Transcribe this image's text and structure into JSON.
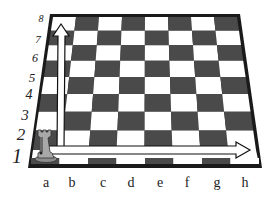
{
  "figure": {
    "colors": {
      "dark_square": "#4a4a4a",
      "light_square": "#ffffff",
      "frame": "#1a1a1a",
      "rook": "#9a9a9a"
    },
    "ranks": [
      {
        "label": "8",
        "x": 41,
        "y": 19,
        "size": 10
      },
      {
        "label": "7",
        "x": 38,
        "y": 39,
        "size": 11
      },
      {
        "label": "6",
        "x": 35,
        "y": 58,
        "size": 12
      },
      {
        "label": "5",
        "x": 32,
        "y": 77,
        "size": 13
      },
      {
        "label": "4",
        "x": 29,
        "y": 95,
        "size": 14
      },
      {
        "label": "3",
        "x": 25,
        "y": 115,
        "size": 15
      },
      {
        "label": "2",
        "x": 21,
        "y": 134,
        "size": 17
      },
      {
        "label": "1",
        "x": 17,
        "y": 156,
        "size": 20
      }
    ],
    "files": [
      {
        "label": "a",
        "x": 46,
        "y": 183
      },
      {
        "label": "b",
        "x": 72,
        "y": 183
      },
      {
        "label": "c",
        "x": 103,
        "y": 183
      },
      {
        "label": "d",
        "x": 131,
        "y": 183
      },
      {
        "label": "e",
        "x": 160,
        "y": 183
      },
      {
        "label": "f",
        "x": 187,
        "y": 183
      },
      {
        "label": "g",
        "x": 217,
        "y": 183
      },
      {
        "label": "h",
        "x": 245,
        "y": 183
      }
    ],
    "piece": {
      "name": "rook",
      "square": "a1",
      "color": "white"
    },
    "arrows": [
      {
        "name": "file-arrow",
        "from": "a1",
        "to": "a8",
        "direction": "up"
      },
      {
        "name": "rank-arrow",
        "from": "a1",
        "to": "h1",
        "direction": "right"
      }
    ]
  }
}
